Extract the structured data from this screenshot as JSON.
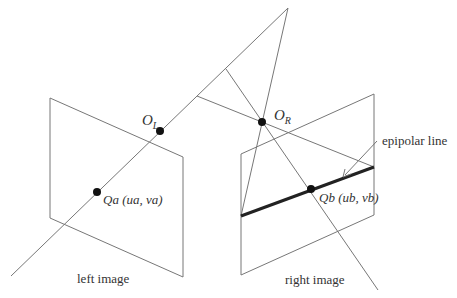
{
  "diagram": {
    "labels": {
      "left_center": {
        "main": "O",
        "sub": "L"
      },
      "right_center": {
        "main": "O",
        "sub": "R"
      },
      "left_point": "Qa (ua, va)",
      "right_point": "Qb (ub, vb)",
      "epipolar_line": "epipolar line",
      "left_image": "left image",
      "right_image": "right image"
    },
    "colors": {
      "line": "#777777",
      "epipolar": "#222222",
      "point": "#111111",
      "text": "#333333"
    }
  }
}
